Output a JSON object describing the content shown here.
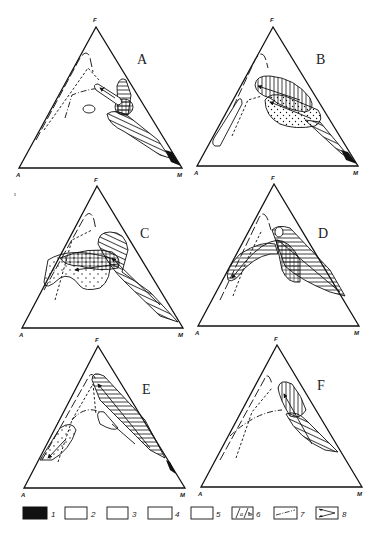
{
  "figure": {
    "panels": [
      {
        "id": "A",
        "label": "A",
        "apex": "F",
        "left": "A",
        "right": "M"
      },
      {
        "id": "B",
        "label": "B",
        "apex": "F",
        "left": "A",
        "right": "M"
      },
      {
        "id": "C",
        "label": "C",
        "apex": "F",
        "left": "A",
        "right": "M"
      },
      {
        "id": "D",
        "label": "D",
        "apex": "F",
        "left": "A",
        "right": "M"
      },
      {
        "id": "E",
        "label": "E",
        "apex": "F",
        "left": "A",
        "right": "M"
      },
      {
        "id": "F",
        "label": "F",
        "apex": "F",
        "left": "A",
        "right": "M"
      }
    ],
    "legend": [
      {
        "num": "1",
        "pattern": "solid-black"
      },
      {
        "num": "2",
        "pattern": "horizontal-hatch"
      },
      {
        "num": "3",
        "pattern": "vertical-hatch"
      },
      {
        "num": "4",
        "pattern": "dotted-dense"
      },
      {
        "num": "5",
        "pattern": "dotted-sparse"
      },
      {
        "num": "6",
        "pattern": "a-b-labeled"
      },
      {
        "num": "7",
        "pattern": "dash-dot-line"
      },
      {
        "num": "8",
        "pattern": "arrow-trend"
      }
    ],
    "stray_mark": "ı"
  }
}
